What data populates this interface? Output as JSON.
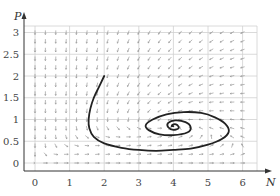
{
  "chart_data": {
    "type": "line",
    "title": "",
    "subtitle": "Direction field with a spiral trajectory",
    "xlabel": "N",
    "ylabel": "P",
    "xlim": [
      -0.6,
      6.3
    ],
    "ylim": [
      -0.18,
      3.25
    ],
    "xticks": [
      "0",
      "1",
      "2",
      "3",
      "4",
      "5",
      "6"
    ],
    "yticks": [
      "0",
      "0.5",
      "1",
      "1.5",
      "2",
      "2.5",
      "3"
    ],
    "grid": true,
    "legend": null,
    "equilibrium": {
      "N": 4.0,
      "P": 0.85
    },
    "series": [
      {
        "name": "trajectory",
        "kind": "spiral into equilibrium",
        "x": [
          2.0,
          1.85,
          1.7,
          1.6,
          1.55,
          1.57,
          1.7,
          2.0,
          2.5,
          3.0,
          3.5,
          4.0,
          4.5,
          5.0,
          5.4,
          5.6,
          5.5,
          5.2,
          4.8,
          4.3,
          3.8,
          3.4,
          3.2,
          3.3,
          3.6,
          4.0,
          4.4,
          4.5,
          4.35,
          4.05,
          3.85,
          3.85,
          4.0,
          4.15,
          4.1,
          4.0,
          3.95,
          4.0
        ],
        "y": [
          2.0,
          1.75,
          1.5,
          1.25,
          1.0,
          0.8,
          0.6,
          0.45,
          0.35,
          0.3,
          0.28,
          0.3,
          0.33,
          0.42,
          0.55,
          0.72,
          0.9,
          1.05,
          1.15,
          1.17,
          1.12,
          1.0,
          0.87,
          0.75,
          0.66,
          0.64,
          0.7,
          0.82,
          0.94,
          0.98,
          0.92,
          0.82,
          0.76,
          0.8,
          0.88,
          0.89,
          0.85,
          0.85
        ]
      }
    ],
    "annotations": [
      "Direction field arrows on a grid over N∈[0,6], P∈[0,3]"
    ]
  },
  "axes": {
    "x_label": "N",
    "y_label": "P",
    "x_ticks": [
      "0",
      "1",
      "2",
      "3",
      "4",
      "5",
      "6"
    ],
    "y_ticks": [
      "0",
      "0.5",
      "1",
      "1.5",
      "2",
      "2.5",
      "3"
    ]
  },
  "colors": {
    "grid": "#d0d0d0",
    "arrow": "#8a8a8a",
    "trajectory": "#222222",
    "axis": "#333333"
  }
}
